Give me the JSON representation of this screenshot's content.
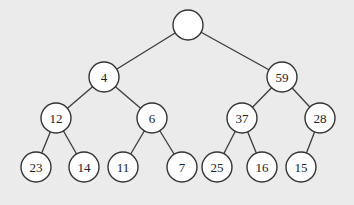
{
  "diagram": {
    "type": "binary-tree",
    "colors": {
      "background": "#ebebeb",
      "node_fill": "#ffffff",
      "node_stroke": "#333333",
      "edge": "#3a3a3a",
      "text": "#222222"
    },
    "node_radius": 15,
    "nodes": [
      {
        "id": "n0",
        "label": "",
        "x": 188,
        "y": 25
      },
      {
        "id": "n1",
        "label": "4",
        "x": 104,
        "y": 77
      },
      {
        "id": "n2",
        "label": "59",
        "x": 282,
        "y": 77
      },
      {
        "id": "n3",
        "label": "12",
        "x": 56,
        "y": 118
      },
      {
        "id": "n4",
        "label": "6",
        "x": 152,
        "y": 118
      },
      {
        "id": "n5",
        "label": "37",
        "x": 242,
        "y": 118
      },
      {
        "id": "n6",
        "label": "28",
        "x": 320,
        "y": 118
      },
      {
        "id": "n7",
        "label": "23",
        "x": 36,
        "y": 167
      },
      {
        "id": "n8",
        "label": "14",
        "x": 84,
        "y": 167
      },
      {
        "id": "n9",
        "label": "11",
        "x": 123,
        "y": 167
      },
      {
        "id": "n10",
        "label": "7",
        "x": 182,
        "y": 167
      },
      {
        "id": "n11",
        "label": "25",
        "x": 217,
        "y": 167
      },
      {
        "id": "n12",
        "label": "16",
        "x": 262,
        "y": 167
      },
      {
        "id": "n13",
        "label": "15",
        "x": 301,
        "y": 167
      }
    ],
    "edges": [
      {
        "from": "n0",
        "to": "n1"
      },
      {
        "from": "n0",
        "to": "n2"
      },
      {
        "from": "n1",
        "to": "n3"
      },
      {
        "from": "n1",
        "to": "n4"
      },
      {
        "from": "n2",
        "to": "n5"
      },
      {
        "from": "n2",
        "to": "n6"
      },
      {
        "from": "n3",
        "to": "n7"
      },
      {
        "from": "n3",
        "to": "n8"
      },
      {
        "from": "n4",
        "to": "n9"
      },
      {
        "from": "n4",
        "to": "n10"
      },
      {
        "from": "n5",
        "to": "n11"
      },
      {
        "from": "n5",
        "to": "n12"
      },
      {
        "from": "n6",
        "to": "n13"
      }
    ]
  }
}
